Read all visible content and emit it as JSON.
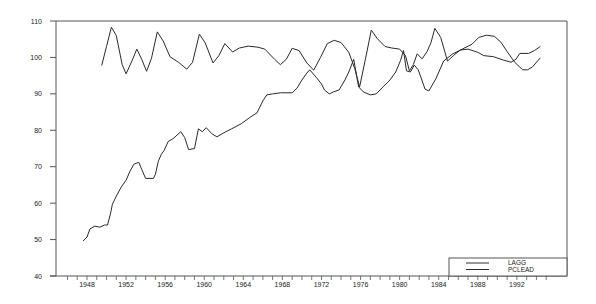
{
  "chart_data": {
    "type": "line",
    "title": "",
    "xlabel": "",
    "ylabel": "",
    "xlim": [
      1945,
      1997
    ],
    "ylim": [
      40,
      110
    ],
    "yticks": [
      40,
      50,
      60,
      70,
      80,
      90,
      100,
      110
    ],
    "xticks": [
      1948,
      1952,
      1956,
      1960,
      1964,
      1968,
      1972,
      1976,
      1980,
      1984,
      1988,
      1992
    ],
    "grid": false,
    "legend_position": "lower right",
    "series": [
      {
        "name": "LAGG",
        "points": [
          [
            1947.6,
            49.6
          ],
          [
            1948.0,
            50.7
          ],
          [
            1948.3,
            52.9
          ],
          [
            1948.8,
            53.7
          ],
          [
            1949.3,
            53.4
          ],
          [
            1949.8,
            54.0
          ],
          [
            1950.1,
            54.0
          ],
          [
            1950.4,
            57.0
          ],
          [
            1950.6,
            59.7
          ],
          [
            1951.0,
            61.9
          ],
          [
            1951.5,
            64.4
          ],
          [
            1952.0,
            66.3
          ],
          [
            1952.4,
            68.8
          ],
          [
            1952.8,
            70.7
          ],
          [
            1953.3,
            71.2
          ],
          [
            1953.6,
            69.3
          ],
          [
            1954.0,
            66.8
          ],
          [
            1954.8,
            66.8
          ],
          [
            1955.0,
            67.9
          ],
          [
            1955.3,
            71.5
          ],
          [
            1955.6,
            73.4
          ],
          [
            1955.9,
            74.5
          ],
          [
            1956.3,
            76.9
          ],
          [
            1956.8,
            77.7
          ],
          [
            1957.6,
            79.6
          ],
          [
            1958.0,
            78.0
          ],
          [
            1958.4,
            74.7
          ],
          [
            1959.0,
            75.0
          ],
          [
            1959.4,
            80.4
          ],
          [
            1959.8,
            79.6
          ],
          [
            1960.2,
            80.7
          ],
          [
            1960.8,
            79.0
          ],
          [
            1961.3,
            78.2
          ],
          [
            1962.0,
            79.3
          ],
          [
            1962.8,
            80.4
          ],
          [
            1963.8,
            81.8
          ],
          [
            1964.6,
            83.4
          ],
          [
            1965.4,
            84.8
          ],
          [
            1966.0,
            88.1
          ],
          [
            1966.4,
            89.7
          ],
          [
            1967.0,
            90.0
          ],
          [
            1967.8,
            90.3
          ],
          [
            1969.0,
            90.3
          ],
          [
            1969.5,
            91.6
          ],
          [
            1970.0,
            93.8
          ],
          [
            1970.5,
            95.7
          ],
          [
            1970.8,
            96.6
          ],
          [
            1971.5,
            94.4
          ],
          [
            1972.0,
            92.7
          ],
          [
            1972.3,
            91.1
          ],
          [
            1972.8,
            90.0
          ],
          [
            1973.2,
            90.5
          ],
          [
            1973.8,
            91.1
          ],
          [
            1974.4,
            93.8
          ],
          [
            1974.8,
            96.0
          ],
          [
            1975.3,
            99.5
          ],
          [
            1975.8,
            91.9
          ],
          [
            1976.3,
            90.5
          ],
          [
            1977.0,
            89.7
          ],
          [
            1977.6,
            90.0
          ],
          [
            1978.3,
            91.9
          ],
          [
            1979.0,
            93.8
          ],
          [
            1979.6,
            96.0
          ],
          [
            1980.1,
            99.2
          ],
          [
            1980.4,
            101.9
          ],
          [
            1980.7,
            96.3
          ],
          [
            1981.1,
            96.0
          ],
          [
            1981.5,
            97.9
          ],
          [
            1981.9,
            96.6
          ],
          [
            1982.2,
            94.4
          ],
          [
            1982.6,
            91.3
          ],
          [
            1983.0,
            90.8
          ],
          [
            1983.7,
            94.1
          ],
          [
            1984.5,
            99.0
          ],
          [
            1985.4,
            100.9
          ],
          [
            1986.4,
            102.3
          ],
          [
            1987.4,
            103.6
          ],
          [
            1988.1,
            105.5
          ],
          [
            1988.9,
            106.1
          ],
          [
            1989.7,
            105.8
          ],
          [
            1990.4,
            104.1
          ],
          [
            1991.0,
            101.6
          ],
          [
            1991.8,
            98.6
          ],
          [
            1992.6,
            96.6
          ],
          [
            1993.1,
            96.6
          ],
          [
            1993.6,
            97.4
          ],
          [
            1994.4,
            99.9
          ]
        ]
      },
      {
        "name": "PCLEAD",
        "points": [
          [
            1949.5,
            97.8
          ],
          [
            1950.0,
            103.0
          ],
          [
            1950.5,
            108.3
          ],
          [
            1951.0,
            106.0
          ],
          [
            1951.6,
            98.0
          ],
          [
            1952.0,
            95.5
          ],
          [
            1952.6,
            99.0
          ],
          [
            1953.1,
            102.3
          ],
          [
            1953.6,
            99.5
          ],
          [
            1954.1,
            96.2
          ],
          [
            1954.6,
            99.8
          ],
          [
            1955.2,
            107.0
          ],
          [
            1955.8,
            104.5
          ],
          [
            1956.5,
            100.2
          ],
          [
            1957.4,
            98.6
          ],
          [
            1958.2,
            96.8
          ],
          [
            1958.8,
            98.6
          ],
          [
            1959.5,
            106.4
          ],
          [
            1960.1,
            104.0
          ],
          [
            1960.9,
            98.5
          ],
          [
            1961.5,
            100.5
          ],
          [
            1962.1,
            103.8
          ],
          [
            1962.9,
            101.5
          ],
          [
            1963.6,
            102.6
          ],
          [
            1964.5,
            103.1
          ],
          [
            1965.5,
            102.8
          ],
          [
            1966.2,
            102.3
          ],
          [
            1967.2,
            99.5
          ],
          [
            1967.8,
            98.0
          ],
          [
            1968.4,
            99.5
          ],
          [
            1969.0,
            102.5
          ],
          [
            1969.7,
            101.9
          ],
          [
            1970.5,
            98.5
          ],
          [
            1971.2,
            96.5
          ],
          [
            1971.9,
            100.0
          ],
          [
            1972.6,
            103.8
          ],
          [
            1973.3,
            104.7
          ],
          [
            1974.0,
            104.1
          ],
          [
            1974.8,
            101.4
          ],
          [
            1975.4,
            97.0
          ],
          [
            1975.9,
            91.9
          ],
          [
            1976.5,
            99.5
          ],
          [
            1977.1,
            107.5
          ],
          [
            1977.7,
            105.2
          ],
          [
            1978.5,
            103.0
          ],
          [
            1979.2,
            102.6
          ],
          [
            1980.0,
            102.3
          ],
          [
            1980.6,
            100.5
          ],
          [
            1981.0,
            96.3
          ],
          [
            1981.4,
            98.0
          ],
          [
            1981.8,
            101.0
          ],
          [
            1982.3,
            99.6
          ],
          [
            1982.8,
            101.6
          ],
          [
            1983.2,
            104.0
          ],
          [
            1983.6,
            108.0
          ],
          [
            1984.2,
            105.5
          ],
          [
            1984.9,
            99.0
          ],
          [
            1985.5,
            100.5
          ],
          [
            1986.2,
            102.0
          ],
          [
            1987.0,
            102.3
          ],
          [
            1988.0,
            101.4
          ],
          [
            1988.6,
            100.5
          ],
          [
            1989.6,
            100.2
          ],
          [
            1990.6,
            99.3
          ],
          [
            1991.4,
            98.7
          ],
          [
            1991.9,
            99.5
          ],
          [
            1992.3,
            101.1
          ],
          [
            1993.2,
            101.1
          ],
          [
            1993.8,
            101.9
          ],
          [
            1994.4,
            103.0
          ]
        ]
      }
    ]
  },
  "legend": {
    "items": [
      {
        "label": "LAGG"
      },
      {
        "label": "PCLEAD"
      }
    ]
  },
  "colors": {
    "line": "#2a2a2a",
    "axis": "#555555",
    "background": "#ffffff"
  }
}
